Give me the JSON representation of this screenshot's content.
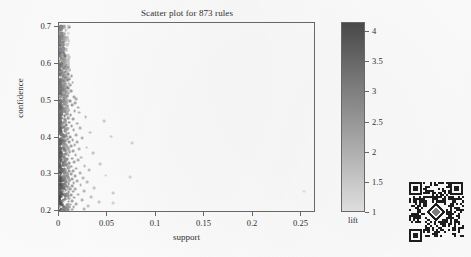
{
  "chart_data": {
    "type": "scatter",
    "title": "Scatter plot for 873 rules",
    "xlabel": "support",
    "ylabel": "confidence",
    "xlim": [
      0,
      0.265
    ],
    "ylim": [
      0.195,
      0.712
    ],
    "grid": false,
    "n_points_reported": 873,
    "x_ticks": [
      0,
      0.05,
      0.1,
      0.15,
      0.2,
      0.25
    ],
    "x_tick_labels": [
      "0",
      "0.05",
      "0.1",
      "0.15",
      "0.2",
      "0.25"
    ],
    "y_ticks": [
      0.2,
      0.3,
      0.4,
      0.5,
      0.6,
      0.7
    ],
    "y_tick_labels": [
      "0.2",
      "0.3",
      "0.4",
      "0.5",
      "0.6",
      "0.7"
    ],
    "colorbar": {
      "title": "lift",
      "position": "right",
      "vmin": 1,
      "vmax": 4.15,
      "ticks": [
        1,
        1.5,
        2,
        2.5,
        3,
        3.5,
        4
      ],
      "tick_labels": [
        "1",
        "1.5",
        "2",
        "2.5",
        "3",
        "3.5",
        "4"
      ],
      "low_color": "#e8e8e8",
      "high_color": "#4a4a4a",
      "orientation": "vertical"
    },
    "series": [
      {
        "name": "rules",
        "encoding": {
          "x": "support",
          "y": "confidence",
          "color": "lift"
        },
        "points": [
          [
            0.004,
            0.7,
            3.8
          ],
          [
            0.0038,
            0.68,
            3.7
          ],
          [
            0.0042,
            0.668,
            3.6
          ],
          [
            0.0045,
            0.66,
            3.9
          ],
          [
            0.004,
            0.652,
            3.5
          ],
          [
            0.0048,
            0.645,
            3.8
          ],
          [
            0.0052,
            0.64,
            3.4
          ],
          [
            0.0043,
            0.632,
            3.6
          ],
          [
            0.0055,
            0.628,
            3.3
          ],
          [
            0.006,
            0.622,
            3.7
          ],
          [
            0.0047,
            0.618,
            3.5
          ],
          [
            0.0065,
            0.613,
            3.2
          ],
          [
            0.005,
            0.61,
            3.6
          ],
          [
            0.007,
            0.607,
            3.4
          ],
          [
            0.0058,
            0.604,
            3.5
          ],
          [
            0.0045,
            0.601,
            3.8
          ],
          [
            0.0075,
            0.598,
            3.1
          ],
          [
            0.0062,
            0.595,
            3.3
          ],
          [
            0.009,
            0.592,
            3.0
          ],
          [
            0.0052,
            0.589,
            3.6
          ],
          [
            0.008,
            0.586,
            3.2
          ],
          [
            0.011,
            0.583,
            2.9
          ],
          [
            0.0068,
            0.58,
            3.4
          ],
          [
            0.0058,
            0.577,
            3.5
          ],
          [
            0.0095,
            0.574,
            3.1
          ],
          [
            0.0048,
            0.571,
            3.7
          ],
          [
            0.013,
            0.568,
            2.7
          ],
          [
            0.0072,
            0.565,
            3.3
          ],
          [
            0.006,
            0.562,
            3.4
          ],
          [
            0.0105,
            0.559,
            3.0
          ],
          [
            0.0085,
            0.556,
            3.2
          ],
          [
            0.005,
            0.553,
            3.6
          ],
          [
            0.014,
            0.55,
            2.6
          ],
          [
            0.0065,
            0.547,
            3.3
          ],
          [
            0.0115,
            0.544,
            2.9
          ],
          [
            0.0055,
            0.541,
            3.5
          ],
          [
            0.0078,
            0.538,
            3.2
          ],
          [
            0.0092,
            0.535,
            3.1
          ],
          [
            0.0062,
            0.532,
            3.4
          ],
          [
            0.0048,
            0.529,
            3.6
          ],
          [
            0.0125,
            0.526,
            2.8
          ],
          [
            0.007,
            0.523,
            3.3
          ],
          [
            0.01,
            0.52,
            3.0
          ],
          [
            0.0058,
            0.517,
            3.4
          ],
          [
            0.0082,
            0.514,
            3.1
          ],
          [
            0.0155,
            0.511,
            2.5
          ],
          [
            0.0066,
            0.508,
            3.3
          ],
          [
            0.018,
            0.505,
            2.4
          ],
          [
            0.0052,
            0.502,
            3.5
          ],
          [
            0.0112,
            0.499,
            2.9
          ],
          [
            0.0075,
            0.496,
            3.2
          ],
          [
            0.017,
            0.494,
            2.5
          ],
          [
            0.006,
            0.491,
            3.3
          ],
          [
            0.0135,
            0.488,
            2.7
          ],
          [
            0.0088,
            0.485,
            3.1
          ],
          [
            0.02,
            0.482,
            2.3
          ],
          [
            0.0055,
            0.479,
            3.4
          ],
          [
            0.0098,
            0.476,
            3.0
          ],
          [
            0.016,
            0.473,
            2.5
          ],
          [
            0.0068,
            0.47,
            3.2
          ],
          [
            0.0205,
            0.468,
            2.2
          ],
          [
            0.008,
            0.465,
            3.1
          ],
          [
            0.012,
            0.462,
            2.8
          ],
          [
            0.0058,
            0.459,
            3.3
          ],
          [
            0.0275,
            0.456,
            2.0
          ],
          [
            0.0092,
            0.453,
            3.0
          ],
          [
            0.0145,
            0.45,
            2.6
          ],
          [
            0.0064,
            0.447,
            3.2
          ],
          [
            0.0465,
            0.444,
            1.7
          ],
          [
            0.0105,
            0.441,
            2.9
          ],
          [
            0.0185,
            0.438,
            2.4
          ],
          [
            0.0072,
            0.435,
            3.1
          ],
          [
            0.013,
            0.432,
            2.7
          ],
          [
            0.0056,
            0.429,
            3.3
          ],
          [
            0.022,
            0.426,
            2.2
          ],
          [
            0.0085,
            0.423,
            3.0
          ],
          [
            0.015,
            0.42,
            2.6
          ],
          [
            0.0062,
            0.417,
            3.2
          ],
          [
            0.032,
            0.414,
            1.9
          ],
          [
            0.0098,
            0.411,
            2.9
          ],
          [
            0.0175,
            0.408,
            2.4
          ],
          [
            0.007,
            0.405,
            3.1
          ],
          [
            0.054,
            0.403,
            1.6
          ],
          [
            0.0115,
            0.401,
            2.8
          ],
          [
            0.0052,
            0.4,
            3.4
          ],
          [
            0.024,
            0.398,
            2.1
          ],
          [
            0.0088,
            0.396,
            3.0
          ],
          [
            0.014,
            0.394,
            2.6
          ],
          [
            0.0066,
            0.391,
            3.2
          ],
          [
            0.019,
            0.389,
            2.3
          ],
          [
            0.0102,
            0.387,
            2.9
          ],
          [
            0.075,
            0.385,
            1.5
          ],
          [
            0.0058,
            0.383,
            3.3
          ],
          [
            0.016,
            0.38,
            2.5
          ],
          [
            0.0122,
            0.378,
            2.7
          ],
          [
            0.0078,
            0.376,
            3.1
          ],
          [
            0.0285,
            0.373,
            2.0
          ],
          [
            0.0092,
            0.371,
            2.9
          ],
          [
            0.0205,
            0.368,
            2.2
          ],
          [
            0.0064,
            0.366,
            3.2
          ],
          [
            0.0145,
            0.363,
            2.6
          ],
          [
            0.011,
            0.361,
            2.8
          ],
          [
            0.035,
            0.358,
            1.8
          ],
          [
            0.0072,
            0.356,
            3.1
          ],
          [
            0.0172,
            0.353,
            2.4
          ],
          [
            0.0098,
            0.351,
            2.9
          ],
          [
            0.0056,
            0.348,
            3.3
          ],
          [
            0.023,
            0.346,
            2.1
          ],
          [
            0.0132,
            0.343,
            2.7
          ],
          [
            0.0085,
            0.341,
            3.0
          ],
          [
            0.0195,
            0.338,
            2.3
          ],
          [
            0.0062,
            0.336,
            3.2
          ],
          [
            0.0155,
            0.333,
            2.5
          ],
          [
            0.0108,
            0.331,
            2.8
          ],
          [
            0.042,
            0.328,
            1.7
          ],
          [
            0.0075,
            0.326,
            3.1
          ],
          [
            0.0265,
            0.323,
            2.0
          ],
          [
            0.0122,
            0.321,
            2.7
          ],
          [
            0.009,
            0.318,
            2.9
          ],
          [
            0.0178,
            0.316,
            2.4
          ],
          [
            0.0058,
            0.314,
            3.2
          ],
          [
            0.031,
            0.312,
            1.9
          ],
          [
            0.0142,
            0.31,
            2.6
          ],
          [
            0.0102,
            0.308,
            2.8
          ],
          [
            0.0735,
            0.292,
            1.5
          ],
          [
            0.0068,
            0.306,
            3.1
          ],
          [
            0.0215,
            0.304,
            2.2
          ],
          [
            0.0128,
            0.301,
            2.7
          ],
          [
            0.0082,
            0.299,
            3.0
          ],
          [
            0.048,
            0.297,
            1.6
          ],
          [
            0.0165,
            0.295,
            2.5
          ],
          [
            0.0095,
            0.293,
            2.9
          ],
          [
            0.0054,
            0.291,
            3.3
          ],
          [
            0.0245,
            0.289,
            2.1
          ],
          [
            0.0138,
            0.287,
            2.6
          ],
          [
            0.011,
            0.285,
            2.8
          ],
          [
            0.0188,
            0.282,
            2.3
          ],
          [
            0.0072,
            0.28,
            3.1
          ],
          [
            0.029,
            0.278,
            2.0
          ],
          [
            0.015,
            0.276,
            2.5
          ],
          [
            0.01,
            0.274,
            2.9
          ],
          [
            0.006,
            0.272,
            3.2
          ],
          [
            0.0222,
            0.27,
            2.2
          ],
          [
            0.0132,
            0.268,
            2.7
          ],
          [
            0.0088,
            0.265,
            3.0
          ],
          [
            0.036,
            0.263,
            1.8
          ],
          [
            0.0168,
            0.261,
            2.4
          ],
          [
            0.0118,
            0.259,
            2.8
          ],
          [
            0.0068,
            0.257,
            3.1
          ],
          [
            0.0258,
            0.255,
            2.1
          ],
          [
            0.0145,
            0.253,
            2.6
          ],
          [
            0.0098,
            0.251,
            2.9
          ],
          [
            0.0555,
            0.249,
            1.6
          ],
          [
            0.0078,
            0.247,
            3.0
          ],
          [
            0.02,
            0.245,
            2.3
          ],
          [
            0.0128,
            0.243,
            2.7
          ],
          [
            0.0092,
            0.241,
            2.9
          ],
          [
            0.033,
            0.239,
            1.9
          ],
          [
            0.0158,
            0.237,
            2.5
          ],
          [
            0.0108,
            0.234,
            2.8
          ],
          [
            0.0064,
            0.232,
            3.1
          ],
          [
            0.0235,
            0.23,
            2.2
          ],
          [
            0.0138,
            0.228,
            2.6
          ],
          [
            0.0098,
            0.226,
            2.9
          ],
          [
            0.041,
            0.224,
            1.7
          ],
          [
            0.056,
            0.222,
            1.5
          ],
          [
            0.018,
            0.22,
            2.4
          ],
          [
            0.012,
            0.218,
            2.7
          ],
          [
            0.0082,
            0.216,
            3.0
          ],
          [
            0.03,
            0.214,
            1.9
          ],
          [
            0.015,
            0.212,
            2.5
          ],
          [
            0.0105,
            0.21,
            2.8
          ],
          [
            0.007,
            0.208,
            3.1
          ],
          [
            0.0255,
            0.206,
            2.1
          ],
          [
            0.0135,
            0.204,
            2.6
          ],
          [
            0.0095,
            0.202,
            2.9
          ],
          [
            0.006,
            0.201,
            3.2
          ],
          [
            0.253,
            0.253,
            1.2
          ],
          [
            0.0105,
            0.7,
            3.0
          ]
        ]
      }
    ],
    "dense_cluster": {
      "description": "Very dense band of points near support 0.001-0.010 spanning the full confidence range",
      "x_range": [
        0.0008,
        0.0105
      ],
      "y_range": [
        0.2,
        0.705
      ],
      "approx_count": 690
    }
  },
  "qr_code": {
    "present": true,
    "description": "QR code with centered diamond logo",
    "position": "bottom-right"
  }
}
